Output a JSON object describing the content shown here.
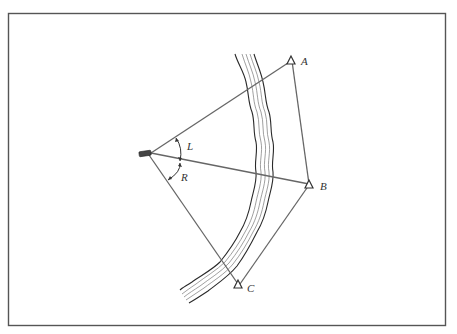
{
  "figure": {
    "stations": [
      {
        "id": "A",
        "label": "A"
      },
      {
        "id": "B",
        "label": "B"
      },
      {
        "id": "C",
        "label": "C"
      }
    ],
    "angles": [
      {
        "id": "L",
        "label": "L",
        "between": [
          "A",
          "B"
        ]
      },
      {
        "id": "R",
        "label": "R",
        "between": [
          "B",
          "C"
        ]
      }
    ],
    "observer": {
      "label": "boat"
    },
    "colors": {
      "line": "#666666",
      "bank": "#2a2a2a",
      "frame": "#555555"
    }
  }
}
